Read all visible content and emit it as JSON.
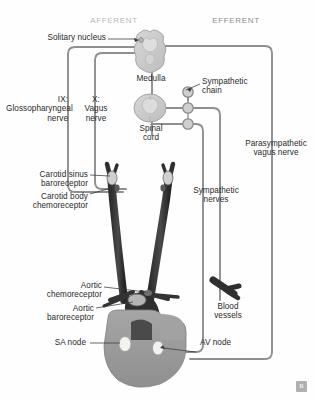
{
  "figure": {
    "title_afferent": "AFFERENT",
    "title_efferent": "EFFERENT",
    "watermark": "R",
    "background": "#fefefe",
    "nerve_line_color": "#8f8f8f",
    "artery_color": "#3a3a3a",
    "heart_color": "#9a9a9a",
    "brain_color": "#c9c9c9",
    "node_color": "#f2f2ef",
    "label_color": "#2a2a2a"
  },
  "labels": {
    "solitary_nucleus": "Solitary nucleus",
    "medulla": "Medulla",
    "spinal_cord": "Spinal\ncord",
    "glossopharyngeal": "IX:\nGlossopharyngeal\nnerve",
    "vagus": "X:\nVagus\nnerve",
    "sympathetic_chain": "Sympathetic\nchain",
    "parasympathetic_vagus": "Parasympathetic\nvagus nerve",
    "sympathetic_nerves": "Sympathetic\nnerves",
    "carotid_sinus": "Carotid sinus\nbaroreceptor",
    "carotid_body": "Carotid body\nchemoreceptor",
    "aortic_chemoreceptor": "Aortic\nchemoreceptor",
    "aortic_baroreceptor": "Aortic\nbaroreceptor",
    "sa_node": "SA node",
    "av_node": "AV node",
    "blood_vessels": "Blood\nvessels"
  }
}
